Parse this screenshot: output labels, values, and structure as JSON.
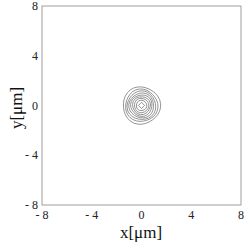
{
  "chart_data": {
    "type": "contour",
    "title": "",
    "xlabel": "x[μm]",
    "ylabel": "y[μm]",
    "xlim": [
      -8,
      8
    ],
    "ylim": [
      -8,
      8
    ],
    "xticks": [
      -8,
      -4,
      0,
      4,
      8
    ],
    "yticks": [
      -8,
      -4,
      0,
      4,
      8
    ],
    "xtick_labels": [
      "- 8",
      "- 4",
      "0",
      "4",
      "8"
    ],
    "ytick_labels": [
      "- 8",
      "- 4",
      "0",
      "4",
      "8"
    ],
    "grid": false,
    "legend": "none",
    "center": [
      0,
      0
    ],
    "contour_radii_um": [
      0.25,
      0.42,
      0.58,
      0.72,
      0.86,
      1.0,
      1.15,
      1.3,
      1.5
    ],
    "line_color": "#666666"
  }
}
